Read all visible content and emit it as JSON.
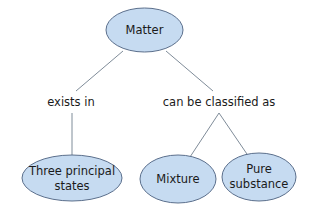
{
  "colors": {
    "node_fill": "#c6dbf1",
    "node_stroke": "#5b6f8c",
    "line": "#7f8c99",
    "text": "#1a1a1a",
    "background": "#ffffff"
  },
  "nodes": {
    "root": {
      "label": "Matter"
    },
    "states": {
      "line1": "Three principal",
      "line2": "states"
    },
    "mixture": {
      "label": "Mixture"
    },
    "pure": {
      "line1": "Pure",
      "line2": "substance"
    }
  },
  "links": {
    "exists_in": "exists in",
    "classified_as": "can be classified as"
  }
}
